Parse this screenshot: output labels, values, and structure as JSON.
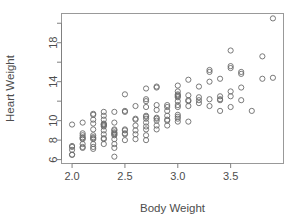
{
  "chart_data": {
    "type": "scatter",
    "title": "",
    "xlabel": "Body Weight",
    "ylabel": "Heart Weight",
    "xlim": [
      1.9,
      4.0
    ],
    "ylim": [
      5.6,
      21.0
    ],
    "xticks": [
      2.0,
      2.5,
      3.0,
      3.5
    ],
    "xtick_labels": [
      "2.0",
      "2.5",
      "3.0",
      "3.5"
    ],
    "yticks": [
      6,
      8,
      10,
      12,
      14,
      16,
      18,
      20
    ],
    "ytick_labels": [
      "6",
      "8",
      "10",
      "",
      "14",
      "",
      "18",
      ""
    ],
    "grid": false,
    "legend": null,
    "marker": "open-circle",
    "marker_color": "#6b6b6b",
    "points": [
      {
        "x": 2.0,
        "y": 6.5
      },
      {
        "x": 2.0,
        "y": 6.5
      },
      {
        "x": 2.0,
        "y": 7.0
      },
      {
        "x": 2.0,
        "y": 7.4
      },
      {
        "x": 2.0,
        "y": 7.3
      },
      {
        "x": 2.0,
        "y": 9.6
      },
      {
        "x": 2.1,
        "y": 7.2
      },
      {
        "x": 2.1,
        "y": 7.3
      },
      {
        "x": 2.1,
        "y": 7.6
      },
      {
        "x": 2.1,
        "y": 8.1
      },
      {
        "x": 2.1,
        "y": 8.2
      },
      {
        "x": 2.1,
        "y": 8.3
      },
      {
        "x": 2.1,
        "y": 8.5
      },
      {
        "x": 2.1,
        "y": 8.7
      },
      {
        "x": 2.1,
        "y": 9.8
      },
      {
        "x": 2.2,
        "y": 7.1
      },
      {
        "x": 2.2,
        "y": 7.3
      },
      {
        "x": 2.2,
        "y": 7.6
      },
      {
        "x": 2.2,
        "y": 8.1
      },
      {
        "x": 2.2,
        "y": 8.2
      },
      {
        "x": 2.2,
        "y": 8.3
      },
      {
        "x": 2.2,
        "y": 8.5
      },
      {
        "x": 2.2,
        "y": 9.1
      },
      {
        "x": 2.2,
        "y": 9.7
      },
      {
        "x": 2.2,
        "y": 10.1
      },
      {
        "x": 2.2,
        "y": 10.6
      },
      {
        "x": 2.2,
        "y": 10.7
      },
      {
        "x": 2.3,
        "y": 7.6
      },
      {
        "x": 2.3,
        "y": 8.1
      },
      {
        "x": 2.3,
        "y": 8.2
      },
      {
        "x": 2.3,
        "y": 8.6
      },
      {
        "x": 2.3,
        "y": 9.0
      },
      {
        "x": 2.3,
        "y": 9.4
      },
      {
        "x": 2.3,
        "y": 9.5
      },
      {
        "x": 2.3,
        "y": 9.6
      },
      {
        "x": 2.3,
        "y": 9.6
      },
      {
        "x": 2.3,
        "y": 9.7
      },
      {
        "x": 2.3,
        "y": 10.1
      },
      {
        "x": 2.3,
        "y": 10.5
      },
      {
        "x": 2.3,
        "y": 10.9
      },
      {
        "x": 2.4,
        "y": 6.3
      },
      {
        "x": 2.4,
        "y": 7.2
      },
      {
        "x": 2.4,
        "y": 7.6
      },
      {
        "x": 2.4,
        "y": 8.1
      },
      {
        "x": 2.4,
        "y": 8.5
      },
      {
        "x": 2.4,
        "y": 8.6
      },
      {
        "x": 2.4,
        "y": 8.7
      },
      {
        "x": 2.4,
        "y": 8.8
      },
      {
        "x": 2.4,
        "y": 9.0
      },
      {
        "x": 2.4,
        "y": 9.1
      },
      {
        "x": 2.4,
        "y": 9.8
      },
      {
        "x": 2.4,
        "y": 10.9
      },
      {
        "x": 2.5,
        "y": 8.0
      },
      {
        "x": 2.5,
        "y": 8.6
      },
      {
        "x": 2.5,
        "y": 8.7
      },
      {
        "x": 2.5,
        "y": 9.0
      },
      {
        "x": 2.5,
        "y": 9.1
      },
      {
        "x": 2.5,
        "y": 10.9
      },
      {
        "x": 2.5,
        "y": 11.0
      },
      {
        "x": 2.5,
        "y": 12.7
      },
      {
        "x": 2.6,
        "y": 8.1
      },
      {
        "x": 2.6,
        "y": 8.6
      },
      {
        "x": 2.6,
        "y": 9.0
      },
      {
        "x": 2.6,
        "y": 9.5
      },
      {
        "x": 2.6,
        "y": 10.1
      },
      {
        "x": 2.6,
        "y": 10.2
      },
      {
        "x": 2.6,
        "y": 11.5
      },
      {
        "x": 2.7,
        "y": 8.0
      },
      {
        "x": 2.7,
        "y": 8.5
      },
      {
        "x": 2.7,
        "y": 9.1
      },
      {
        "x": 2.7,
        "y": 9.4
      },
      {
        "x": 2.7,
        "y": 9.8
      },
      {
        "x": 2.7,
        "y": 10.2
      },
      {
        "x": 2.7,
        "y": 10.4
      },
      {
        "x": 2.7,
        "y": 10.5
      },
      {
        "x": 2.7,
        "y": 11.4
      },
      {
        "x": 2.7,
        "y": 12.0
      },
      {
        "x": 2.7,
        "y": 12.2
      },
      {
        "x": 2.7,
        "y": 13.3
      },
      {
        "x": 2.8,
        "y": 9.1
      },
      {
        "x": 2.8,
        "y": 9.5
      },
      {
        "x": 2.8,
        "y": 10.0
      },
      {
        "x": 2.8,
        "y": 10.2
      },
      {
        "x": 2.8,
        "y": 10.3
      },
      {
        "x": 2.8,
        "y": 11.1
      },
      {
        "x": 2.8,
        "y": 11.6
      },
      {
        "x": 2.8,
        "y": 13.4
      },
      {
        "x": 2.8,
        "y": 13.5
      },
      {
        "x": 2.9,
        "y": 9.5
      },
      {
        "x": 2.9,
        "y": 10.0
      },
      {
        "x": 2.9,
        "y": 10.1
      },
      {
        "x": 2.9,
        "y": 10.5
      },
      {
        "x": 2.9,
        "y": 11.0
      },
      {
        "x": 2.9,
        "y": 11.4
      },
      {
        "x": 2.9,
        "y": 11.6
      },
      {
        "x": 3.0,
        "y": 9.9
      },
      {
        "x": 3.0,
        "y": 10.2
      },
      {
        "x": 3.0,
        "y": 10.4
      },
      {
        "x": 3.0,
        "y": 10.6
      },
      {
        "x": 3.0,
        "y": 11.4
      },
      {
        "x": 3.0,
        "y": 11.6
      },
      {
        "x": 3.0,
        "y": 12.0
      },
      {
        "x": 3.0,
        "y": 12.4
      },
      {
        "x": 3.0,
        "y": 12.5
      },
      {
        "x": 3.0,
        "y": 12.6
      },
      {
        "x": 3.0,
        "y": 12.7
      },
      {
        "x": 3.0,
        "y": 13.0
      },
      {
        "x": 3.0,
        "y": 13.6
      },
      {
        "x": 3.1,
        "y": 9.9
      },
      {
        "x": 3.1,
        "y": 11.5
      },
      {
        "x": 3.1,
        "y": 12.0
      },
      {
        "x": 3.1,
        "y": 12.1
      },
      {
        "x": 3.1,
        "y": 12.6
      },
      {
        "x": 3.1,
        "y": 14.2
      },
      {
        "x": 3.2,
        "y": 11.8
      },
      {
        "x": 3.2,
        "y": 12.1
      },
      {
        "x": 3.2,
        "y": 12.4
      },
      {
        "x": 3.2,
        "y": 13.5
      },
      {
        "x": 3.3,
        "y": 11.5
      },
      {
        "x": 3.3,
        "y": 12.2
      },
      {
        "x": 3.3,
        "y": 14.0
      },
      {
        "x": 3.3,
        "y": 15.0
      },
      {
        "x": 3.3,
        "y": 15.2
      },
      {
        "x": 3.4,
        "y": 11.0
      },
      {
        "x": 3.4,
        "y": 12.1
      },
      {
        "x": 3.4,
        "y": 12.2
      },
      {
        "x": 3.4,
        "y": 12.5
      },
      {
        "x": 3.4,
        "y": 14.3
      },
      {
        "x": 3.5,
        "y": 11.4
      },
      {
        "x": 3.5,
        "y": 12.5
      },
      {
        "x": 3.5,
        "y": 13.0
      },
      {
        "x": 3.5,
        "y": 15.4
      },
      {
        "x": 3.5,
        "y": 15.6
      },
      {
        "x": 3.5,
        "y": 17.2
      },
      {
        "x": 3.6,
        "y": 12.1
      },
      {
        "x": 3.6,
        "y": 13.4
      },
      {
        "x": 3.6,
        "y": 14.8
      },
      {
        "x": 3.6,
        "y": 15.0
      },
      {
        "x": 3.7,
        "y": 11.0
      },
      {
        "x": 3.8,
        "y": 14.3
      },
      {
        "x": 3.8,
        "y": 16.6
      },
      {
        "x": 3.9,
        "y": 14.4
      },
      {
        "x": 3.9,
        "y": 20.5
      }
    ]
  },
  "axis_titles": {
    "x": "Body Weight",
    "y": "Heart Weight"
  }
}
